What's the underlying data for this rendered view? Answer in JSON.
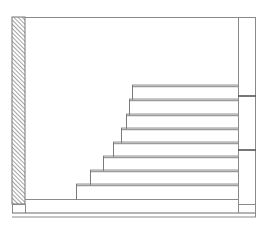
{
  "drawing": {
    "type": "staircase-section",
    "colors": {
      "line": "#8a8a8a",
      "hatch": "#666666",
      "background": "#ffffff"
    },
    "frame": {
      "left": 12,
      "top": 17,
      "right": 256,
      "bottom": 217
    },
    "wall": {
      "x": 12,
      "width": 13,
      "top": 17,
      "bottom": 204,
      "pattern": "diagonal-hatch"
    },
    "right_column": {
      "x1": 238,
      "x2": 256,
      "marks_y": [
        96,
        150
      ],
      "base_y": 204
    },
    "floor": {
      "y": 200,
      "x1": 25,
      "x2": 238
    },
    "base_lines_y": [
      213,
      217
    ],
    "steps": [
      {
        "tread_y": 86,
        "nose_x": 132
      },
      {
        "tread_y": 100,
        "nose_x": 129
      },
      {
        "tread_y": 115,
        "nose_x": 126
      },
      {
        "tread_y": 129,
        "nose_x": 121
      },
      {
        "tread_y": 143,
        "nose_x": 113
      },
      {
        "tread_y": 157,
        "nose_x": 103
      },
      {
        "tread_y": 171,
        "nose_x": 90
      },
      {
        "tread_y": 185,
        "nose_x": 76
      }
    ]
  }
}
